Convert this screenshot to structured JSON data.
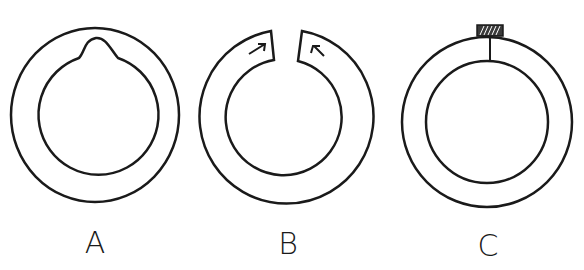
{
  "figures": [
    {
      "id": "A",
      "label": "A",
      "description": "Ring with inward bump on inner edge at top"
    },
    {
      "id": "B",
      "label": "B",
      "description": "Split ring with gap at top; arrows point toward the gap"
    },
    {
      "id": "C",
      "label": "C",
      "description": "Ring with radial line at top and hatched tab on outer edge"
    }
  ],
  "colors": {
    "stroke": "#1a1a1a",
    "background": "#ffffff"
  }
}
